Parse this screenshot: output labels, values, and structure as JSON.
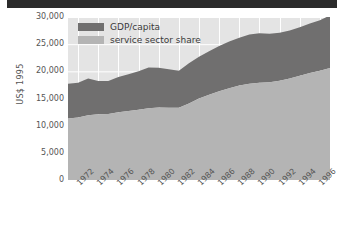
{
  "banner": {
    "name": "top-dark-bar",
    "color": "#2b2b2b"
  },
  "chart_data": {
    "type": "area",
    "stacked": true,
    "title": "",
    "subtitle": "",
    "xlabel": "",
    "ylabel": "US$ 1995",
    "ylim": [
      0,
      30000
    ],
    "xlim": [
      1971,
      1997
    ],
    "grid": true,
    "grid_color": "#ffffff",
    "plot_background": "#e4e4e4",
    "legend_position": "top-left-inside",
    "y_ticks": [
      0,
      5000,
      10000,
      15000,
      20000,
      25000,
      30000
    ],
    "y_tick_labels": [
      "0",
      "5,000",
      "10,000",
      "15,000",
      "20,000",
      "25,000",
      "30,000"
    ],
    "x_ticks": [
      1972,
      1974,
      1976,
      1978,
      1980,
      1982,
      1984,
      1986,
      1988,
      1990,
      1992,
      1994,
      1996
    ],
    "x_tick_labels": [
      "1972",
      "1974",
      "1976",
      "1978",
      "1980",
      "1982",
      "1984",
      "1986",
      "1988",
      "1990",
      "1992",
      "1994",
      "1996"
    ],
    "x": [
      1971,
      1972,
      1973,
      1974,
      1975,
      1976,
      1977,
      1978,
      1979,
      1980,
      1981,
      1982,
      1983,
      1984,
      1985,
      1986,
      1987,
      1988,
      1989,
      1990,
      1991,
      1992,
      1993,
      1994,
      1995,
      1996,
      1997
    ],
    "series": [
      {
        "name": "service sector share",
        "color": "#b4b4b4",
        "stack_order": 1,
        "values": [
          11300,
          11500,
          11900,
          12100,
          12150,
          12450,
          12700,
          12950,
          13200,
          13350,
          13300,
          13300,
          14100,
          15000,
          15700,
          16350,
          16900,
          17400,
          17700,
          17900,
          18000,
          18250,
          18700,
          19200,
          19700,
          20100,
          20600
        ]
      },
      {
        "name": "GDP/capita",
        "color": "#706f6f",
        "stack_order": 2,
        "note": "upper band; series total equals GDP/capita",
        "values": [
          6400,
          6400,
          6800,
          6100,
          6050,
          6500,
          6750,
          7050,
          7500,
          7300,
          7100,
          6800,
          7400,
          7700,
          8000,
          8300,
          8600,
          8800,
          9100,
          9100,
          8900,
          8850,
          8800,
          8900,
          9100,
          9300,
          9700
        ]
      }
    ],
    "totals": {
      "name": "GDP/capita (top of stack)",
      "values": [
        17700,
        17900,
        18700,
        18200,
        18200,
        18950,
        19450,
        20000,
        20700,
        20650,
        20400,
        20100,
        21500,
        22700,
        23700,
        24650,
        25500,
        26200,
        26800,
        27000,
        26900,
        27100,
        27500,
        28100,
        28800,
        29400,
        30300
      ]
    },
    "legend": [
      {
        "label": "GDP/capita",
        "color": "#706f6f"
      },
      {
        "label": "service sector share",
        "color": "#b4b4b4"
      }
    ]
  }
}
